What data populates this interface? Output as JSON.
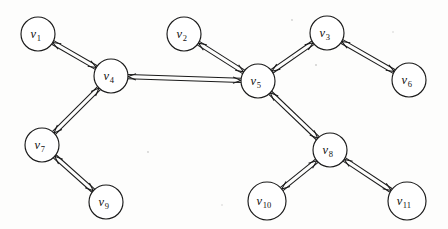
{
  "figure": {
    "title": "",
    "type": "directed-graph-diagram",
    "background_color": "#fdfdfc",
    "stroke_color": "#1a1a1a",
    "node_fill": "#ffffff",
    "width": 448,
    "height": 229
  },
  "graph": {
    "node_radius": 17,
    "edge_style": "double-line bidirectional arrow",
    "nodes": [
      {
        "id": "v1",
        "label": "v",
        "sub": "1",
        "cx": 38,
        "cy": 34,
        "r": 17
      },
      {
        "id": "v2",
        "label": "v",
        "sub": "2",
        "cx": 184,
        "cy": 34,
        "r": 17
      },
      {
        "id": "v3",
        "label": "v",
        "sub": "3",
        "cx": 327,
        "cy": 33,
        "r": 17
      },
      {
        "id": "v4",
        "label": "v",
        "sub": "4",
        "cx": 111,
        "cy": 76,
        "r": 17
      },
      {
        "id": "v5",
        "label": "v",
        "sub": "5",
        "cx": 258,
        "cy": 81,
        "r": 17
      },
      {
        "id": "v6",
        "label": "v",
        "sub": "6",
        "cx": 409,
        "cy": 80,
        "r": 17
      },
      {
        "id": "v7",
        "label": "v",
        "sub": "7",
        "cx": 42,
        "cy": 145,
        "r": 17
      },
      {
        "id": "v8",
        "label": "v",
        "sub": "8",
        "cx": 330,
        "cy": 150,
        "r": 17
      },
      {
        "id": "v9",
        "label": "v",
        "sub": "9",
        "cx": 106,
        "cy": 202,
        "r": 17
      },
      {
        "id": "v10",
        "label": "v",
        "sub": "10",
        "cx": 267,
        "cy": 201,
        "r": 19
      },
      {
        "id": "v11",
        "label": "v",
        "sub": "11",
        "cx": 407,
        "cy": 201,
        "r": 19
      }
    ],
    "edges": [
      {
        "from": "v1",
        "to": "v4",
        "bidirectional": true
      },
      {
        "from": "v4",
        "to": "v5",
        "bidirectional": true
      },
      {
        "from": "v4",
        "to": "v7",
        "bidirectional": true
      },
      {
        "from": "v2",
        "to": "v5",
        "bidirectional": true
      },
      {
        "from": "v5",
        "to": "v3",
        "bidirectional": true
      },
      {
        "from": "v3",
        "to": "v6",
        "bidirectional": true
      },
      {
        "from": "v5",
        "to": "v8",
        "bidirectional": true
      },
      {
        "from": "v7",
        "to": "v9",
        "bidirectional": true
      },
      {
        "from": "v8",
        "to": "v10",
        "bidirectional": true
      },
      {
        "from": "v8",
        "to": "v11",
        "bidirectional": true
      }
    ]
  }
}
